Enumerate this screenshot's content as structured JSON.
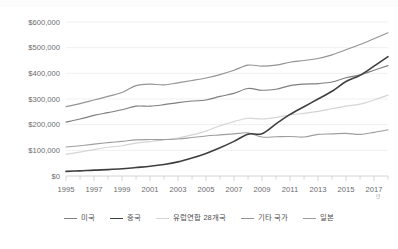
{
  "chart_data": {
    "type": "line",
    "title": "",
    "subtitle": "",
    "xlabel": "년",
    "ylabel": "",
    "x": [
      1995,
      1996,
      1997,
      1998,
      1999,
      2000,
      2001,
      2002,
      2003,
      2004,
      2005,
      2006,
      2007,
      2008,
      2009,
      2010,
      2011,
      2012,
      2013,
      2014,
      2015,
      2016,
      2017,
      2018
    ],
    "xlim": [
      1995,
      2018
    ],
    "ylim": [
      0,
      600000
    ],
    "yticks": [
      0,
      100000,
      200000,
      300000,
      400000,
      500000,
      600000
    ],
    "ytick_labels": [
      "$0",
      "$100,000",
      "$200,000",
      "$300,000",
      "$400,000",
      "$500,000",
      "$600,000"
    ],
    "xticks": [
      1995,
      1997,
      1999,
      2001,
      2003,
      2005,
      2007,
      2009,
      2011,
      2013,
      2015,
      2017
    ],
    "xtick_labels": [
      "1995",
      "1997",
      "1999",
      "2001",
      "2003",
      "2005",
      "2007",
      "2009",
      "2011",
      "2013",
      "2015",
      "2017"
    ],
    "grid": "horizontal",
    "legend_position": "bottom",
    "series": [
      {
        "name": "미국",
        "color": "#7f7f7f",
        "width": 1.15,
        "values": [
          210000,
          222000,
          236000,
          247000,
          258000,
          272000,
          272000,
          278000,
          286000,
          292000,
          296000,
          310000,
          322000,
          341000,
          334000,
          338000,
          352000,
          358000,
          360000,
          366000,
          383000,
          394000,
          412000,
          430000
        ]
      },
      {
        "name": "중국",
        "color": "#3f3f3f",
        "width": 1.6,
        "values": [
          18000,
          20000,
          23000,
          25000,
          28000,
          33000,
          38000,
          45000,
          55000,
          70000,
          88000,
          110000,
          135000,
          163000,
          165000,
          203000,
          240000,
          270000,
          300000,
          330000,
          368000,
          392000,
          428000,
          465000
        ]
      },
      {
        "name": "유럽연합 28개국",
        "color": "#d5d5d5",
        "width": 1.15,
        "values": [
          85000,
          93000,
          103000,
          112000,
          118000,
          128000,
          134000,
          141000,
          148000,
          160000,
          175000,
          196000,
          212000,
          225000,
          222000,
          228000,
          238000,
          244000,
          252000,
          262000,
          272000,
          280000,
          296000,
          315000
        ]
      },
      {
        "name": "기타 국가",
        "color": "#949494",
        "width": 1.15,
        "values": [
          270000,
          282000,
          296000,
          310000,
          325000,
          352000,
          358000,
          355000,
          363000,
          372000,
          382000,
          395000,
          412000,
          432000,
          428000,
          432000,
          443000,
          450000,
          458000,
          472000,
          492000,
          512000,
          535000,
          558000
        ]
      },
      {
        "name": "일본",
        "color": "#9e9e9e",
        "width": 1.15,
        "values": [
          113000,
          118000,
          124000,
          130000,
          135000,
          141000,
          142000,
          142000,
          144000,
          150000,
          156000,
          160000,
          164000,
          168000,
          152000,
          153000,
          154000,
          152000,
          162000,
          164000,
          166000,
          162000,
          170000,
          180000
        ]
      }
    ]
  }
}
